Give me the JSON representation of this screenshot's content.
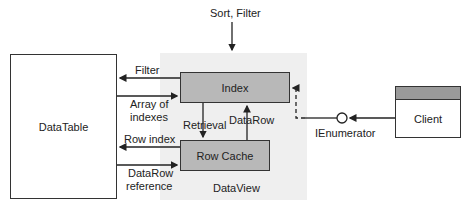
{
  "diagram": {
    "title_input": "Sort, Filter",
    "nodes": {
      "datatable": {
        "label": "DataTable"
      },
      "dataview": {
        "label": "DataView"
      },
      "index": {
        "label": "Index"
      },
      "row_cache": {
        "label": "Row Cache"
      },
      "client": {
        "label": "Client"
      },
      "ienumerator": {
        "label": "IEnumerator"
      }
    },
    "edges": {
      "filter": "Filter",
      "array_of_indexes_1": "Array of",
      "array_of_indexes_2": "indexes",
      "row_index": "Row index",
      "datarow_reference_1": "DataRow",
      "datarow_reference_2": "reference",
      "retrieval": "Retrieval",
      "datarow": "DataRow"
    },
    "colors": {
      "dataview_bg": "#efefef",
      "inner_box_fill": "#b8b8b8",
      "client_header": "#9a9a9a",
      "line": "#222222"
    }
  }
}
